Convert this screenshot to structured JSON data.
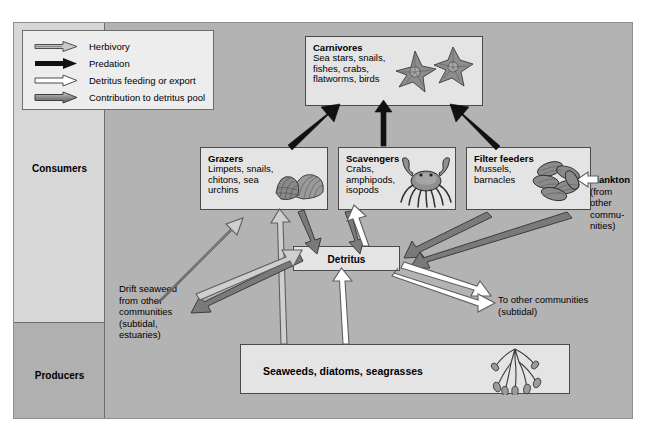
{
  "diagram": {
    "colors": {
      "background": "#b3b3b3",
      "consumers_band": "#d7d7d7",
      "producers_band": "#b0b0b0",
      "box_fill": "#e4e4e4",
      "legend_fill": "#ededed",
      "herbivory_arrow": "#909090",
      "predation_arrow": "#111111",
      "detritus_feeding_arrow": "#ffffff",
      "detritus_pool_arrow": "#6e6e6e"
    }
  },
  "legend": {
    "items": [
      {
        "label": "Herbivory",
        "style": "gray-outline",
        "icon": "arrow-right-icon"
      },
      {
        "label": "Predation",
        "style": "solid-black",
        "icon": "arrow-right-icon"
      },
      {
        "label": "Detritus feeding or export",
        "style": "white-outline",
        "icon": "arrow-right-icon"
      },
      {
        "label": "Contribution to detritus pool",
        "style": "dark-gray",
        "icon": "arrow-right-icon"
      }
    ]
  },
  "levels": [
    {
      "name": "consumers",
      "label": "Consumers"
    },
    {
      "name": "producers",
      "label": "Producers"
    }
  ],
  "boxes": {
    "carnivores": {
      "title": "Carnivores",
      "body": "Sea stars, snails,\nfishes, crabs,\nflatworms, birds",
      "lines": [
        "Sea stars, snails,",
        "fishes, crabs,",
        "flatworms, birds"
      ],
      "art": "sea-stars-illustration"
    },
    "grazers": {
      "title": "Grazers",
      "lines": [
        "Limpets, snails,",
        "chitons, sea",
        "urchins"
      ],
      "art": "limpet-shells-illustration"
    },
    "scavengers": {
      "title": "Scavengers",
      "lines": [
        "Crabs,",
        "amphipods,",
        "isopods"
      ],
      "art": "crab-illustration"
    },
    "filter_feeders": {
      "title": "Filter feeders",
      "lines": [
        "Mussels,",
        "barnacles"
      ],
      "art": "mussels-illustration"
    },
    "detritus": {
      "label": "Detritus"
    },
    "producers": {
      "label": "Seaweeds, diatoms, seagrasses",
      "art": "seagrass-illustration"
    }
  },
  "annotations": {
    "plankton": {
      "title": "Plankton",
      "lines": [
        "(from",
        "other",
        "commu-",
        "nities)"
      ]
    },
    "drift_seaweed": {
      "lines": [
        "Drift seaweed",
        "from other",
        "communities",
        "(subtidal,",
        "estuaries)"
      ]
    },
    "export": {
      "lines": [
        "To other communities",
        "(subtidal)"
      ]
    }
  },
  "flows": [
    {
      "from": "grazers",
      "to": "carnivores",
      "type": "predation"
    },
    {
      "from": "scavengers",
      "to": "carnivores",
      "type": "predation"
    },
    {
      "from": "filter_feeders",
      "to": "carnivores",
      "type": "predation"
    },
    {
      "from": "producers",
      "to": "grazers",
      "type": "herbivory"
    },
    {
      "from": "drift_seaweed",
      "to": "grazers",
      "type": "herbivory"
    },
    {
      "from": "plankton",
      "to": "filter_feeders",
      "type": "detritus_feeding"
    },
    {
      "from": "grazers",
      "to": "detritus",
      "type": "detritus_pool"
    },
    {
      "from": "scavengers",
      "to": "detritus",
      "type": "detritus_pool"
    },
    {
      "from": "carnivores",
      "to": "detritus",
      "type": "detritus_pool"
    },
    {
      "from": "filter_feeders",
      "to": "detritus",
      "type": "detritus_pool"
    },
    {
      "from": "detritus",
      "to": "scavengers",
      "type": "detritus_feeding"
    },
    {
      "from": "detritus",
      "to": "filter_feeders",
      "type": "detritus_feeding"
    },
    {
      "from": "producers",
      "to": "detritus",
      "type": "detritus_feeding"
    },
    {
      "from": "drift_seaweed",
      "to": "detritus",
      "type": "detritus_pool"
    },
    {
      "from": "detritus",
      "to": "export",
      "type": "detritus_feeding"
    }
  ]
}
